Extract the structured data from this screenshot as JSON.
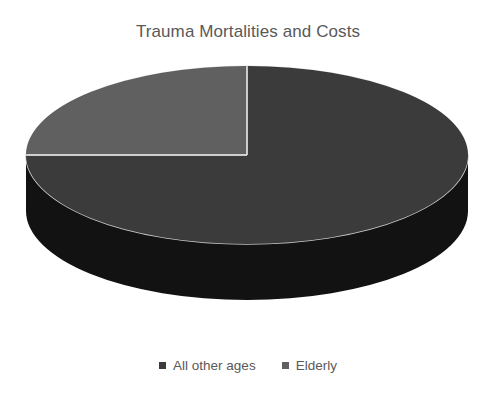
{
  "chart_data": {
    "type": "pie",
    "title": "Trauma Mortalities and Costs",
    "xlabel": "",
    "ylabel": "",
    "categories": [
      "All other ages",
      "Elderly"
    ],
    "values": [
      75,
      25
    ],
    "value_unit": "percent",
    "labels_shown": false,
    "legend_position": "bottom",
    "three_d": true,
    "start_angle_deg": 0,
    "direction": "clockwise",
    "grid": false,
    "slices": [
      {
        "name": "All other ages",
        "value": 75,
        "percent": "75%",
        "color": "#3b3b3b",
        "side_color": "#121212",
        "start_deg": 0,
        "end_deg": 270
      },
      {
        "name": "Elderly",
        "value": 25,
        "percent": "25%",
        "color": "#606060",
        "side_color": "#2a2a2a",
        "start_deg": 270,
        "end_deg": 360
      }
    ]
  },
  "title": {
    "text": "Trauma Mortalities and Costs"
  },
  "legend": {
    "items": [
      {
        "label": "All other ages",
        "color": "#3b3b3b",
        "marker": "square-marker"
      },
      {
        "label": "Elderly",
        "color": "#606060",
        "marker": "square-marker"
      }
    ]
  },
  "colors": {
    "background": "#ffffff",
    "title_text": "#595959",
    "legend_text": "#595959",
    "slice_all_other_ages": "#3b3b3b",
    "slice_elderly": "#606060",
    "side_wall": "#121212",
    "separator_line": "#d9d9d9"
  },
  "geometry": {
    "center_x": 247,
    "center_y": 155,
    "radius_x": 221,
    "radius_y": 89,
    "depth": 56
  }
}
